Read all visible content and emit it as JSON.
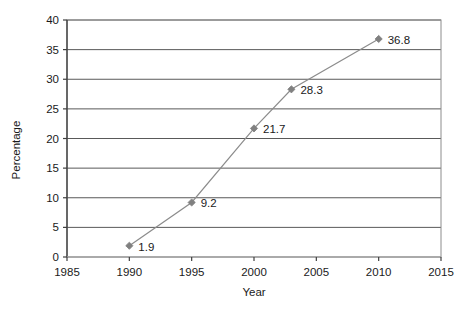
{
  "chart_data": {
    "type": "line",
    "title": "",
    "xlabel": "Year",
    "ylabel": "Percentage",
    "x": [
      1990,
      1995,
      2000,
      2003,
      2010
    ],
    "values": [
      1.9,
      9.2,
      21.7,
      28.3,
      36.8
    ],
    "point_labels": [
      "1.9",
      "9.2",
      "21.7",
      "28.3",
      "36.8"
    ],
    "xlim": [
      1985,
      2015
    ],
    "ylim": [
      0,
      40
    ],
    "xticks": [
      1985,
      1990,
      1995,
      2000,
      2005,
      2010,
      2015
    ],
    "xtick_labels": [
      "1985",
      "1990",
      "1995",
      "2000",
      "2005",
      "2010",
      "2015"
    ],
    "yticks": [
      0,
      5,
      10,
      15,
      20,
      25,
      30,
      35,
      40
    ],
    "ytick_labels": [
      "0",
      "5",
      "10",
      "15",
      "20",
      "25",
      "30",
      "35",
      "40"
    ],
    "grid": {
      "horizontal": true,
      "vertical": false
    },
    "legend": {
      "visible": false,
      "position": "none"
    },
    "marker": "diamond",
    "colors": {
      "line": "#8c8c8c",
      "marker": "#808080",
      "gridline": "#595959",
      "axis": "#404040",
      "plot_border": "#808080",
      "text": "#1a1a1a",
      "background": "#ffffff"
    }
  }
}
